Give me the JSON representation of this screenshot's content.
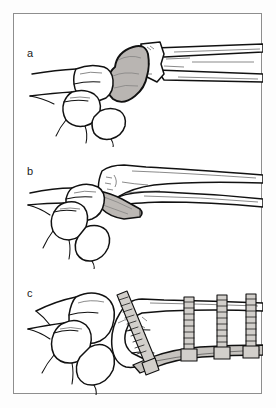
{
  "figure": {
    "border_color": "#8e8e8e",
    "background_color": "#ffffff",
    "line_color": "#111111",
    "fragment_fill": "#b9b5b2",
    "implant_fill": "#c6c3bf"
  },
  "panels": [
    {
      "label": "a",
      "name": "panel-a",
      "caption": "Displaced intra-articular fragment of the distal radius, shaded",
      "structures": [
        "carpal-bones",
        "displaced-articular-fragment",
        "radius-shaft",
        "fracture-surface"
      ]
    },
    {
      "label": "b",
      "name": "panel-b",
      "caption": "Volar wedge fragment separated from the distal radius",
      "structures": [
        "carpal-bones",
        "radius-shaft",
        "volar-wedge-fragment"
      ]
    },
    {
      "label": "c",
      "name": "panel-c",
      "caption": "Fixation with volar plate and four screws",
      "structures": [
        "carpal-bones",
        "reduced-radius",
        "volar-plate",
        "screw",
        "screw",
        "screw",
        "screw"
      ],
      "screw_count": "4"
    }
  ]
}
